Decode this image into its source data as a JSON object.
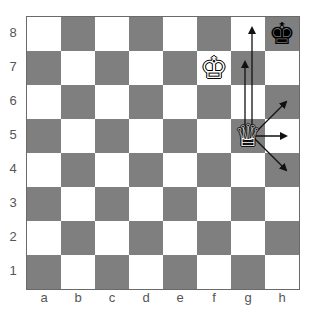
{
  "board": {
    "files": [
      "a",
      "b",
      "c",
      "d",
      "e",
      "f",
      "g",
      "h"
    ],
    "ranks": [
      "8",
      "7",
      "6",
      "5",
      "4",
      "3",
      "2",
      "1"
    ],
    "colors": {
      "light": "#ffffff",
      "dark": "#7f7f7f",
      "border": "#6a6a6a",
      "arrow": "#111111"
    }
  },
  "pieces": [
    {
      "square": "h8",
      "type": "king",
      "color": "black",
      "glyph": "♚"
    },
    {
      "square": "f7",
      "type": "king",
      "color": "white",
      "glyph": "♔"
    },
    {
      "square": "g5",
      "type": "queen",
      "color": "white",
      "glyph": "♕"
    }
  ],
  "arrows": [
    {
      "from": "g5",
      "to": "g7"
    },
    {
      "from": "g5",
      "to": "g8"
    },
    {
      "from": "g5",
      "to": "h6"
    },
    {
      "from": "g5",
      "to": "h5"
    },
    {
      "from": "g5",
      "to": "h4"
    }
  ]
}
